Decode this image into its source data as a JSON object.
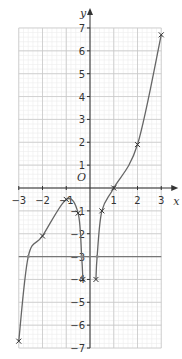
{
  "chart_data": {
    "type": "line",
    "title": "",
    "xlabel": "x",
    "ylabel": "y",
    "origin_label": "O",
    "xlim": [
      -3,
      3
    ],
    "ylim": [
      -7,
      7
    ],
    "x_ticks": [
      -3,
      -2,
      -1,
      1,
      2,
      3
    ],
    "y_ticks": [
      7,
      6,
      5,
      4,
      3,
      2,
      1,
      -1,
      -2,
      -3,
      -4,
      -5,
      -6,
      -7
    ],
    "x_tick_labels": [
      "−3",
      "−2",
      "−1",
      "1",
      "2",
      "3"
    ],
    "y_tick_labels": [
      "7",
      "6",
      "5",
      "4",
      "3",
      "2",
      "1",
      "−1",
      "−2",
      "−3",
      "−4",
      "−5",
      "−6",
      "−7"
    ],
    "grid": true,
    "minor_grid_step": 0.2,
    "series": [
      {
        "name": "curve branch left (x<0)",
        "points": [
          [
            -3,
            -6.7
          ],
          [
            -2.6,
            -3
          ],
          [
            -2,
            -2.1
          ],
          [
            -1,
            -0.5
          ],
          [
            -0.5,
            -1.1
          ],
          [
            -0.35,
            -3
          ],
          [
            -0.3,
            -4
          ]
        ]
      },
      {
        "name": "curve branch right (x>0)",
        "points": [
          [
            0.25,
            -4
          ],
          [
            0.3,
            -3
          ],
          [
            0.5,
            -1
          ],
          [
            1,
            0
          ],
          [
            2,
            1.9
          ],
          [
            3,
            6.7
          ]
        ]
      },
      {
        "name": "horizontal line y = -3",
        "points": [
          [
            -3,
            -3
          ],
          [
            3,
            -3
          ]
        ]
      }
    ],
    "marked_points": [
      [
        -3,
        -6.7
      ],
      [
        -2,
        -2.1
      ],
      [
        -1,
        -0.5
      ],
      [
        -0.5,
        -1.1
      ],
      [
        -0.3,
        -4
      ],
      [
        0.25,
        -4
      ],
      [
        0.5,
        -1
      ],
      [
        1,
        0
      ],
      [
        2,
        1.9
      ],
      [
        3,
        6.7
      ]
    ],
    "intersections_with_y_eq_minus3": [
      [
        -2.6,
        -3
      ],
      [
        -0.35,
        -3
      ],
      [
        0.3,
        -3
      ]
    ],
    "colors": {
      "curve": "#666666",
      "line": "#777777",
      "grid_major": "#c8c8c8",
      "grid_minor": "#ececec",
      "axis": "#333333"
    }
  }
}
